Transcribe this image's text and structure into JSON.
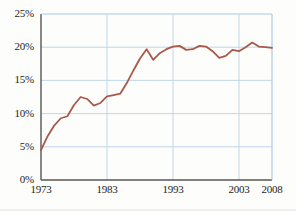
{
  "chart_data": {
    "type": "line",
    "title": "",
    "subtitle": "",
    "xlabel": "",
    "ylabel": "",
    "xlim": [
      1973,
      2008
    ],
    "ylim": [
      0,
      25
    ],
    "yticks": [
      0,
      5,
      10,
      15,
      20,
      25
    ],
    "ytick_labels": [
      "0%",
      "5%",
      "10%",
      "15%",
      "20%",
      "25%"
    ],
    "xticks": [
      1973,
      1983,
      1993,
      2003,
      2008
    ],
    "xtick_labels": [
      "1973",
      "1983",
      "1993",
      "2003",
      "2008"
    ],
    "grid": true,
    "grid_color": "#b9d2e8",
    "legend": null,
    "legend_position": "none",
    "line_color": "#a85a4a",
    "line_width": 1.8,
    "axis_color": "#555555",
    "x": [
      1973,
      1974,
      1975,
      1976,
      1977,
      1978,
      1979,
      1980,
      1981,
      1982,
      1983,
      1984,
      1985,
      1986,
      1987,
      1988,
      1989,
      1990,
      1991,
      1992,
      1993,
      1994,
      1995,
      1996,
      1997,
      1998,
      1999,
      2000,
      2001,
      2002,
      2003,
      2004,
      2005,
      2006,
      2007,
      2008
    ],
    "values": [
      4.5,
      6.6,
      8.2,
      9.3,
      9.6,
      11.3,
      12.5,
      12.2,
      11.2,
      11.6,
      12.6,
      12.8,
      13.0,
      14.6,
      16.5,
      18.3,
      19.7,
      18.1,
      19.1,
      19.7,
      20.1,
      20.2,
      19.6,
      19.7,
      20.2,
      20.1,
      19.4,
      18.4,
      18.7,
      19.6,
      19.4,
      20.0,
      20.7,
      20.1,
      20.0,
      19.9
    ],
    "series": [
      {
        "name": "percent-series",
        "color": "#a85a4a",
        "values": [
          4.5,
          6.6,
          8.2,
          9.3,
          9.6,
          11.3,
          12.5,
          12.2,
          11.2,
          11.6,
          12.6,
          12.8,
          13.0,
          14.6,
          16.5,
          18.3,
          19.7,
          18.1,
          19.1,
          19.7,
          20.1,
          20.2,
          19.6,
          19.7,
          20.2,
          20.1,
          19.4,
          18.4,
          18.7,
          19.6,
          19.4,
          20.0,
          20.7,
          20.1,
          20.0,
          19.9
        ]
      }
    ],
    "annotations": []
  }
}
